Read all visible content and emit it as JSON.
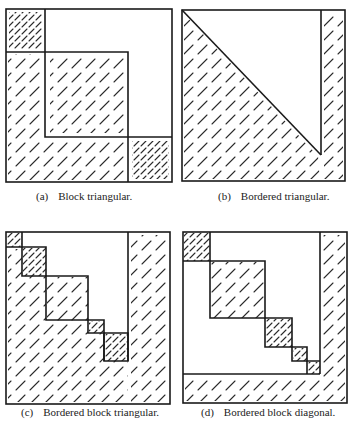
{
  "figure": {
    "panels": [
      {
        "id": "a",
        "tag": "(a)",
        "caption": "Block triangular."
      },
      {
        "id": "b",
        "tag": "(b)",
        "caption": "Bordered triangular."
      },
      {
        "id": "c",
        "tag": "(c)",
        "caption": "Bordered block triangular."
      },
      {
        "id": "d",
        "tag": "(d)",
        "caption": "Bordered block diagonal."
      }
    ]
  }
}
